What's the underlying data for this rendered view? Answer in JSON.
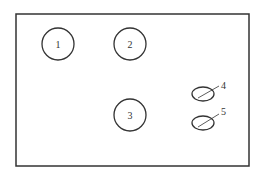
{
  "diagram": {
    "frame": {
      "x": 16,
      "y": 14,
      "width": 233,
      "height": 152,
      "stroke": "#333333"
    },
    "circles": [
      {
        "id": "1",
        "label": "1",
        "cx": 58,
        "cy": 44,
        "r": 16
      },
      {
        "id": "2",
        "label": "2",
        "cx": 130,
        "cy": 44,
        "r": 16
      },
      {
        "id": "3",
        "label": "3",
        "cx": 130,
        "cy": 115,
        "r": 16
      }
    ],
    "ellipses": [
      {
        "id": "4",
        "label": "4",
        "cx": 203,
        "cy": 94,
        "rx": 11,
        "ry": 7
      },
      {
        "id": "5",
        "label": "5",
        "cx": 203,
        "cy": 123,
        "rx": 11,
        "ry": 7
      }
    ]
  }
}
